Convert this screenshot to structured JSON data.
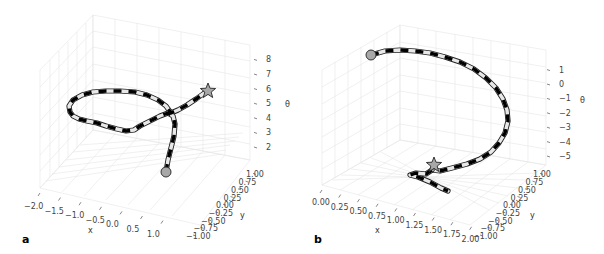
{
  "chart_data": [
    {
      "type": "line3d",
      "panel_label": "a",
      "title": "",
      "xlabel": "x",
      "ylabel": "y",
      "zlabel": "θ",
      "x_ticks": [
        "−2.0",
        "−1.5",
        "−1.0",
        "−0.5",
        "0.0",
        "0.5",
        "1.0"
      ],
      "y_ticks": [
        "−1.00",
        "−0.75",
        "−0.50",
        "−0.25",
        "0.00",
        "0.25",
        "0.50",
        "0.75",
        "1.00"
      ],
      "z_ticks": [
        "2",
        "3",
        "4",
        "5",
        "6",
        "7",
        "8"
      ],
      "xlim": [
        -2.2,
        1.2
      ],
      "ylim": [
        -1.0,
        1.0
      ],
      "zlim": [
        1.5,
        8.5
      ],
      "grid": true,
      "start_marker": "circle",
      "end_marker": "star",
      "line_style": "alternating black/white dashed tube",
      "path_2d": [
        [
          166,
          172
        ],
        [
          168,
          160
        ],
        [
          171,
          148
        ],
        [
          174,
          136
        ],
        [
          175,
          124
        ],
        [
          173,
          116
        ],
        [
          168,
          113
        ],
        [
          160,
          116
        ],
        [
          150,
          121
        ],
        [
          140,
          126
        ],
        [
          134,
          130
        ],
        [
          126,
          131
        ],
        [
          117,
          129
        ],
        [
          106,
          126
        ],
        [
          97,
          123
        ],
        [
          87,
          121
        ],
        [
          79,
          119
        ],
        [
          73,
          116
        ],
        [
          70,
          112
        ],
        [
          69,
          106
        ],
        [
          73,
          100
        ],
        [
          82,
          95
        ],
        [
          93,
          92
        ],
        [
          106,
          91
        ],
        [
          120,
          91
        ],
        [
          135,
          92
        ],
        [
          147,
          95
        ],
        [
          158,
          100
        ],
        [
          166,
          106
        ],
        [
          171,
          113
        ],
        [
          178,
          110
        ],
        [
          187,
          105
        ],
        [
          196,
          99
        ],
        [
          203,
          94
        ],
        [
          208,
          91
        ]
      ],
      "start_xy": [
        166,
        172
      ],
      "end_xy": [
        208,
        91
      ]
    },
    {
      "type": "line3d",
      "panel_label": "b",
      "title": "",
      "xlabel": "x",
      "ylabel": "y",
      "zlabel": "θ",
      "x_ticks": [
        "0.00",
        "0.25",
        "0.50",
        "0.75",
        "1.00",
        "1.25",
        "1.50",
        "1.75",
        "2.00"
      ],
      "y_ticks": [
        "−1.00",
        "−0.75",
        "−0.50",
        "−0.25",
        "0.00",
        "0.25",
        "0.50",
        "0.75",
        "1.00"
      ],
      "z_ticks": [
        "−5",
        "−4",
        "−3",
        "−2",
        "−1",
        "0",
        "1"
      ],
      "xlim": [
        0.0,
        2.0
      ],
      "ylim": [
        -1.0,
        1.0
      ],
      "zlim": [
        -5.5,
        1.5
      ],
      "grid": true,
      "start_marker": "circle",
      "end_marker": "star",
      "line_style": "alternating black/white dashed tube",
      "path_2d": [
        [
          371,
          55
        ],
        [
          385,
          51
        ],
        [
          400,
          50
        ],
        [
          415,
          51
        ],
        [
          430,
          53
        ],
        [
          445,
          57
        ],
        [
          460,
          62
        ],
        [
          474,
          69
        ],
        [
          486,
          78
        ],
        [
          496,
          88
        ],
        [
          503,
          99
        ],
        [
          507,
          110
        ],
        [
          508,
          121
        ],
        [
          505,
          133
        ],
        [
          499,
          143
        ],
        [
          491,
          152
        ],
        [
          480,
          159
        ],
        [
          467,
          164
        ],
        [
          452,
          168
        ],
        [
          440,
          171
        ],
        [
          432,
          170
        ]
      ],
      "tail_2d": [
        [
          432,
          170
        ],
        [
          426,
          174
        ],
        [
          416,
          173
        ],
        [
          410,
          175
        ],
        [
          418,
          177
        ],
        [
          430,
          182
        ],
        [
          441,
          188
        ],
        [
          448,
          191
        ]
      ],
      "start_xy": [
        371,
        55
      ],
      "end_xy": [
        434,
        165
      ]
    }
  ]
}
